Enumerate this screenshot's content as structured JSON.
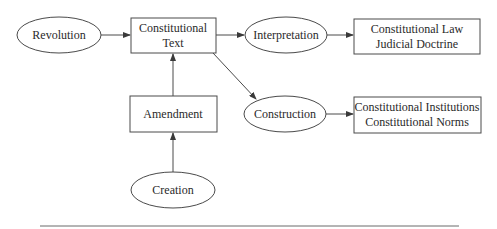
{
  "diagram": {
    "nodes": {
      "revolution": {
        "shape": "ellipse",
        "lines": [
          "Revolution"
        ]
      },
      "constitutional_text": {
        "shape": "rect",
        "lines": [
          "Constitutional",
          "Text"
        ]
      },
      "interpretation": {
        "shape": "ellipse",
        "lines": [
          "Interpretation"
        ]
      },
      "constitutional_law": {
        "shape": "rect",
        "lines": [
          "Constitutional Law",
          "Judicial Doctrine"
        ]
      },
      "amendment": {
        "shape": "rect",
        "lines": [
          "Amendment"
        ]
      },
      "construction": {
        "shape": "ellipse",
        "lines": [
          "Construction"
        ]
      },
      "constitutional_institutions": {
        "shape": "rect",
        "lines": [
          "Constitutional Institutions",
          "Constitutional Norms"
        ]
      },
      "creation": {
        "shape": "ellipse",
        "lines": [
          "Creation"
        ]
      }
    },
    "edges": [
      {
        "from": "Revolution",
        "to": "Constitutional Text"
      },
      {
        "from": "Constitutional Text",
        "to": "Interpretation"
      },
      {
        "from": "Interpretation",
        "to": "Constitutional Law / Judicial Doctrine"
      },
      {
        "from": "Constitutional Text",
        "to": "Construction"
      },
      {
        "from": "Construction",
        "to": "Constitutional Institutions / Constitutional Norms"
      },
      {
        "from": "Amendment",
        "to": "Constitutional Text"
      },
      {
        "from": "Creation",
        "to": "Amendment"
      }
    ],
    "colors": {
      "stroke": "#4a4a4a",
      "text": "#2a2a2a",
      "background": "#ffffff"
    }
  }
}
